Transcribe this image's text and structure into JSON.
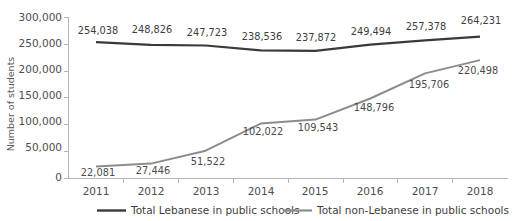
{
  "chart_data": {
    "type": "line",
    "title": "",
    "subtitle": "",
    "xlabel": "",
    "ylabel": "Number of students",
    "categories": [
      "2011",
      "2012",
      "2013",
      "2014",
      "2015",
      "2016",
      "2017",
      "2018"
    ],
    "ylim": [
      0,
      300000
    ],
    "ytick_labels": [
      "0",
      "50,000",
      "100,000",
      "150,000",
      "200,000",
      "250,000",
      "300,000"
    ],
    "ytick_values": [
      0,
      50000,
      100000,
      150000,
      200000,
      250000,
      300000
    ],
    "grid": false,
    "legend_position": "bottom",
    "series": [
      {
        "name": "Total Lebanese in public schools",
        "color": "#3a3a3a",
        "values": [
          254038,
          248826,
          247723,
          238536,
          237872,
          249494,
          257378,
          264231
        ],
        "labels": [
          "254,038",
          "248,826",
          "247,723",
          "238,536",
          "237,872",
          "249,494",
          "257,378",
          "264,231"
        ]
      },
      {
        "name": "Total non-Lebanese in public schools",
        "color": "#8c8c8c",
        "values": [
          22081,
          27446,
          51522,
          102022,
          109543,
          148796,
          195706,
          220498
        ],
        "labels": [
          "22,081",
          "27,446",
          "51,522",
          "102,022",
          "109,543",
          "148,796",
          "195,706",
          "220,498"
        ]
      }
    ]
  },
  "legend": {
    "items": [
      {
        "label": "Total Lebanese in public schools",
        "color": "#3a3a3a"
      },
      {
        "label": "Total non-Lebanese in public schools",
        "color": "#8c8c8c"
      }
    ]
  }
}
